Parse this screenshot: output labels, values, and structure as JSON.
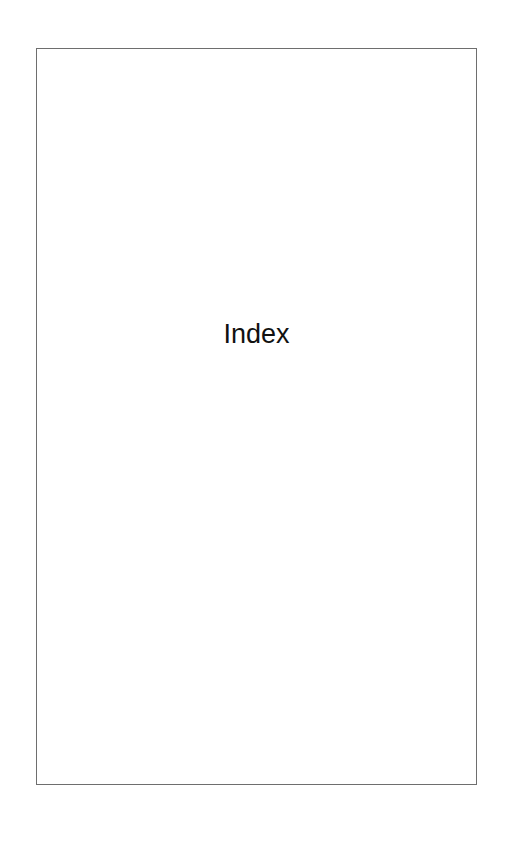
{
  "page": {
    "title": "Index"
  },
  "colors": {
    "border": "#6e6e6e",
    "text": "#111111",
    "background": "#ffffff"
  }
}
